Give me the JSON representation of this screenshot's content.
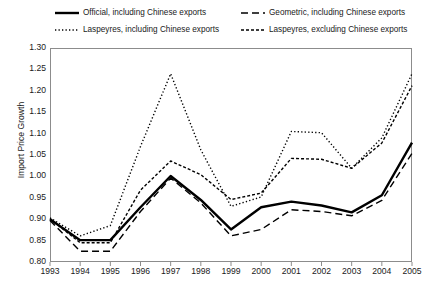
{
  "chart_data": {
    "type": "line",
    "title": "",
    "xlabel": "",
    "ylabel": "Import Price Growth",
    "x": [
      1993,
      1994,
      1995,
      1996,
      1997,
      1998,
      1999,
      2000,
      2001,
      2002,
      2003,
      2004,
      2005
    ],
    "xtick_labels": [
      "1993",
      "1994",
      "1995",
      "1996",
      "1997",
      "1998",
      "1999",
      "2000",
      "2001",
      "2002",
      "2003",
      "2004",
      "2005"
    ],
    "ytick_labels": [
      "0.80",
      "0.85",
      "0.90",
      "0.95",
      "1.00",
      "1.05",
      "1.10",
      "1.15",
      "1.20",
      "1.25",
      "1.30"
    ],
    "ylim": [
      0.8,
      1.3
    ],
    "ytick_step": 0.05,
    "xlim": [
      1993,
      2005
    ],
    "grid": false,
    "legend_position": "above-plot",
    "series": [
      {
        "name": "Official, including Chinese exports",
        "style": "solid",
        "values": [
          0.9,
          0.851,
          0.851,
          0.928,
          1.001,
          0.945,
          0.876,
          0.928,
          0.941,
          0.932,
          0.916,
          0.956,
          1.079
        ]
      },
      {
        "name": "Geometric, including Chinese exports",
        "style": "dashed",
        "values": [
          0.897,
          0.825,
          0.825,
          0.918,
          0.996,
          0.938,
          0.861,
          0.876,
          0.922,
          0.918,
          0.908,
          0.944,
          1.054
        ]
      },
      {
        "name": "Laspeyres, including Chinese exports",
        "style": "dotted",
        "values": [
          0.903,
          0.861,
          0.885,
          1.07,
          1.24,
          1.062,
          0.93,
          0.952,
          1.105,
          1.102,
          1.019,
          1.09,
          1.24
        ]
      },
      {
        "name": "Laspeyres, excluding Chinese exports",
        "style": "dash-dot",
        "values": [
          0.901,
          0.845,
          0.845,
          0.968,
          1.036,
          1.004,
          0.946,
          0.961,
          1.042,
          1.04,
          1.019,
          1.078,
          1.212
        ]
      }
    ]
  },
  "legend": {
    "items": [
      {
        "label": "Official, including Chinese exports",
        "key": "solid-line-key"
      },
      {
        "label": "Geometric, including Chinese exports",
        "key": "dashed-line-key"
      },
      {
        "label": "Laspeyres, including Chinese exports",
        "key": "dotted-line-key"
      },
      {
        "label": "Laspeyres, excluding Chinese exports",
        "key": "dash-dot-line-key"
      }
    ]
  },
  "colors": {
    "line": "#000000",
    "axis": "#8c8c8c",
    "text": "#1a1a1a",
    "background": "#ffffff"
  }
}
